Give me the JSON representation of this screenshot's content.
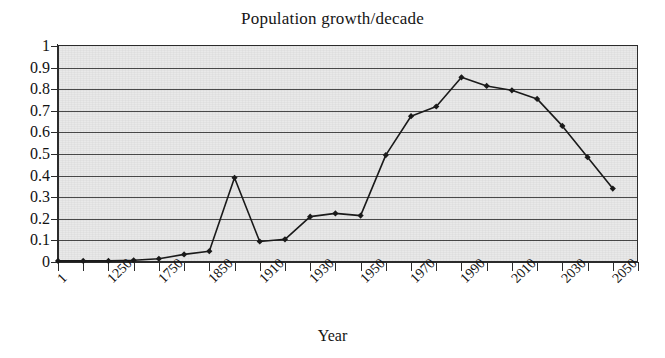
{
  "chart_data": {
    "type": "line",
    "title": "Population growth/decade",
    "xlabel": "Year",
    "ylabel": "",
    "ylim": [
      0,
      1
    ],
    "ytick_labels": [
      "1",
      "0.9",
      "0.8",
      "0.7",
      "0.6",
      "0.5",
      "0.4",
      "0.3",
      "0.2",
      "0.1",
      "0"
    ],
    "ytick_values": [
      1,
      0.9,
      0.8,
      0.7,
      0.6,
      0.5,
      0.4,
      0.3,
      0.2,
      0.1,
      0
    ],
    "grid": true,
    "legend": "none",
    "marker": "diamond",
    "line_color": "#1a1a1a",
    "plot_background": "#e9e9e9",
    "categories": [
      "1",
      "1000",
      "1250",
      "1500",
      "1750",
      "1800",
      "1850",
      "1880",
      "1910",
      "1920",
      "1930",
      "1940",
      "1950",
      "1960",
      "1970",
      "1980",
      "1990",
      "2000",
      "2010",
      "2020",
      "2030",
      "2040",
      "2050",
      "2060"
    ],
    "xtick_labels": [
      "1",
      "1250",
      "1750",
      "1850",
      "1910",
      "1930",
      "1950",
      "1970",
      "1990",
      "2010",
      "2030",
      "2050"
    ],
    "xtick_label_indices": [
      0,
      2,
      4,
      6,
      8,
      10,
      12,
      14,
      16,
      18,
      20,
      22
    ],
    "values": [
      0.005,
      0.005,
      0.005,
      0.008,
      0.015,
      0.035,
      0.05,
      0.39,
      0.095,
      0.105,
      0.21,
      0.225,
      0.215,
      0.495,
      0.675,
      0.72,
      0.855,
      0.815,
      0.795,
      0.755,
      0.63,
      0.485,
      0.34,
      null
    ],
    "points": [
      {
        "x": "1",
        "y": 0.005
      },
      {
        "x": "1000",
        "y": 0.005
      },
      {
        "x": "1250",
        "y": 0.005
      },
      {
        "x": "1500",
        "y": 0.008
      },
      {
        "x": "1750",
        "y": 0.015
      },
      {
        "x": "1800",
        "y": 0.035
      },
      {
        "x": "1850",
        "y": 0.05
      },
      {
        "x": "1880",
        "y": 0.39
      },
      {
        "x": "1910",
        "y": 0.095
      },
      {
        "x": "1920",
        "y": 0.105
      },
      {
        "x": "1930",
        "y": 0.21
      },
      {
        "x": "1940",
        "y": 0.225
      },
      {
        "x": "1950",
        "y": 0.215
      },
      {
        "x": "1960",
        "y": 0.495
      },
      {
        "x": "1970",
        "y": 0.675
      },
      {
        "x": "1980",
        "y": 0.72
      },
      {
        "x": "1990",
        "y": 0.855
      },
      {
        "x": "2000",
        "y": 0.815
      },
      {
        "x": "2010",
        "y": 0.795
      },
      {
        "x": "2020",
        "y": 0.755
      },
      {
        "x": "2030",
        "y": 0.63
      },
      {
        "x": "2040",
        "y": 0.485
      },
      {
        "x": "2050",
        "y": 0.34
      }
    ]
  }
}
